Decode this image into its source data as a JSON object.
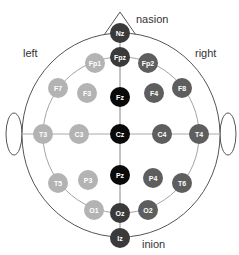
{
  "diagram": {
    "labels": {
      "nasion": "nasion",
      "inion": "inion",
      "left": "left",
      "right": "right"
    },
    "colors": {
      "left_hemisphere": "#b3b3b3",
      "midline": "#0a0a0a",
      "midline_outer": "#3a3a3a",
      "right_hemisphere": "#5e5e5e",
      "lines": "#888888",
      "outline": "#555555"
    },
    "electrodes": [
      {
        "id": "Nz",
        "label": "Nz",
        "x": 120,
        "y": 33,
        "group": "midline_outer"
      },
      {
        "id": "Fpz",
        "label": "Fpz",
        "x": 120,
        "y": 57,
        "group": "midline_outer"
      },
      {
        "id": "Fz",
        "label": "Fz",
        "x": 120,
        "y": 97,
        "group": "midline"
      },
      {
        "id": "Cz",
        "label": "Cz",
        "x": 120,
        "y": 134,
        "group": "midline"
      },
      {
        "id": "Pz",
        "label": "Pz",
        "x": 120,
        "y": 175,
        "group": "midline"
      },
      {
        "id": "Oz",
        "label": "Oz",
        "x": 120,
        "y": 213,
        "group": "midline_outer"
      },
      {
        "id": "Iz",
        "label": "Iz",
        "x": 120,
        "y": 238,
        "group": "midline_outer"
      },
      {
        "id": "Fp1",
        "label": "Fp1",
        "x": 95,
        "y": 63,
        "group": "left_hemisphere"
      },
      {
        "id": "F7",
        "label": "F7",
        "x": 58,
        "y": 88,
        "group": "left_hemisphere"
      },
      {
        "id": "F3",
        "label": "F3",
        "x": 87,
        "y": 93,
        "group": "left_hemisphere"
      },
      {
        "id": "T3",
        "label": "T3",
        "x": 43,
        "y": 134,
        "group": "left_hemisphere"
      },
      {
        "id": "C3",
        "label": "C3",
        "x": 79,
        "y": 134,
        "group": "left_hemisphere"
      },
      {
        "id": "T5",
        "label": "T5",
        "x": 58,
        "y": 183,
        "group": "left_hemisphere"
      },
      {
        "id": "P3",
        "label": "P3",
        "x": 88,
        "y": 180,
        "group": "left_hemisphere"
      },
      {
        "id": "O1",
        "label": "O1",
        "x": 94,
        "y": 210,
        "group": "left_hemisphere"
      },
      {
        "id": "Fp2",
        "label": "Fp2",
        "x": 148,
        "y": 63,
        "group": "right_hemisphere"
      },
      {
        "id": "F8",
        "label": "F8",
        "x": 182,
        "y": 88,
        "group": "right_hemisphere"
      },
      {
        "id": "F4",
        "label": "F4",
        "x": 154,
        "y": 93,
        "group": "right_hemisphere"
      },
      {
        "id": "C4",
        "label": "C4",
        "x": 162,
        "y": 134,
        "group": "right_hemisphere"
      },
      {
        "id": "T4",
        "label": "T4",
        "x": 199,
        "y": 134,
        "group": "right_hemisphere"
      },
      {
        "id": "P4",
        "label": "P4",
        "x": 153,
        "y": 178,
        "group": "right_hemisphere"
      },
      {
        "id": "T6",
        "label": "T6",
        "x": 182,
        "y": 183,
        "group": "right_hemisphere"
      },
      {
        "id": "O2",
        "label": "O2",
        "x": 148,
        "y": 210,
        "group": "right_hemisphere"
      }
    ]
  }
}
